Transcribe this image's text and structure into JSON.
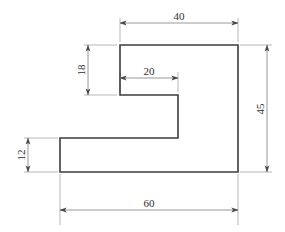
{
  "drawing": {
    "type": "engineering-orthographic-view",
    "title": "",
    "units": "mm",
    "line_color": "#3c3c3c",
    "dimension_color": "#7d7d7d",
    "text_color": "#2e2e2e",
    "background": "#ffffff"
  },
  "dimensions": [
    {
      "id": "top-width",
      "label": "40",
      "orientation": "horizontal",
      "position": "top",
      "measures": "upper flange width"
    },
    {
      "id": "notch-height",
      "label": "18",
      "orientation": "vertical",
      "position": "left-upper",
      "measures": "upper arm thickness"
    },
    {
      "id": "notch-width",
      "label": "20",
      "orientation": "horizontal",
      "position": "inner",
      "measures": "inner notch width"
    },
    {
      "id": "overall-height",
      "label": "45",
      "orientation": "vertical",
      "position": "right",
      "measures": "overall height"
    },
    {
      "id": "base-height",
      "label": "12",
      "orientation": "vertical",
      "position": "left-lower",
      "measures": "base thickness"
    },
    {
      "id": "overall-width",
      "label": "60",
      "orientation": "horizontal",
      "position": "bottom",
      "measures": "overall width"
    }
  ],
  "geometry": {
    "outline_points": "120,45 238,45 238,172 60,172 60,138 178,138 178,95 120,95",
    "vertices": [
      {
        "name": "top-left",
        "x": 120,
        "y": 45
      },
      {
        "name": "top-right",
        "x": 238,
        "y": 45
      },
      {
        "name": "bottom-right",
        "x": 238,
        "y": 172
      },
      {
        "name": "bottom-left",
        "x": 60,
        "y": 172
      },
      {
        "name": "base-inner-left",
        "x": 60,
        "y": 138
      },
      {
        "name": "base-inner-right",
        "x": 178,
        "y": 138
      },
      {
        "name": "notch-inner-right",
        "x": 178,
        "y": 95
      },
      {
        "name": "notch-inner-left",
        "x": 120,
        "y": 95
      }
    ]
  }
}
